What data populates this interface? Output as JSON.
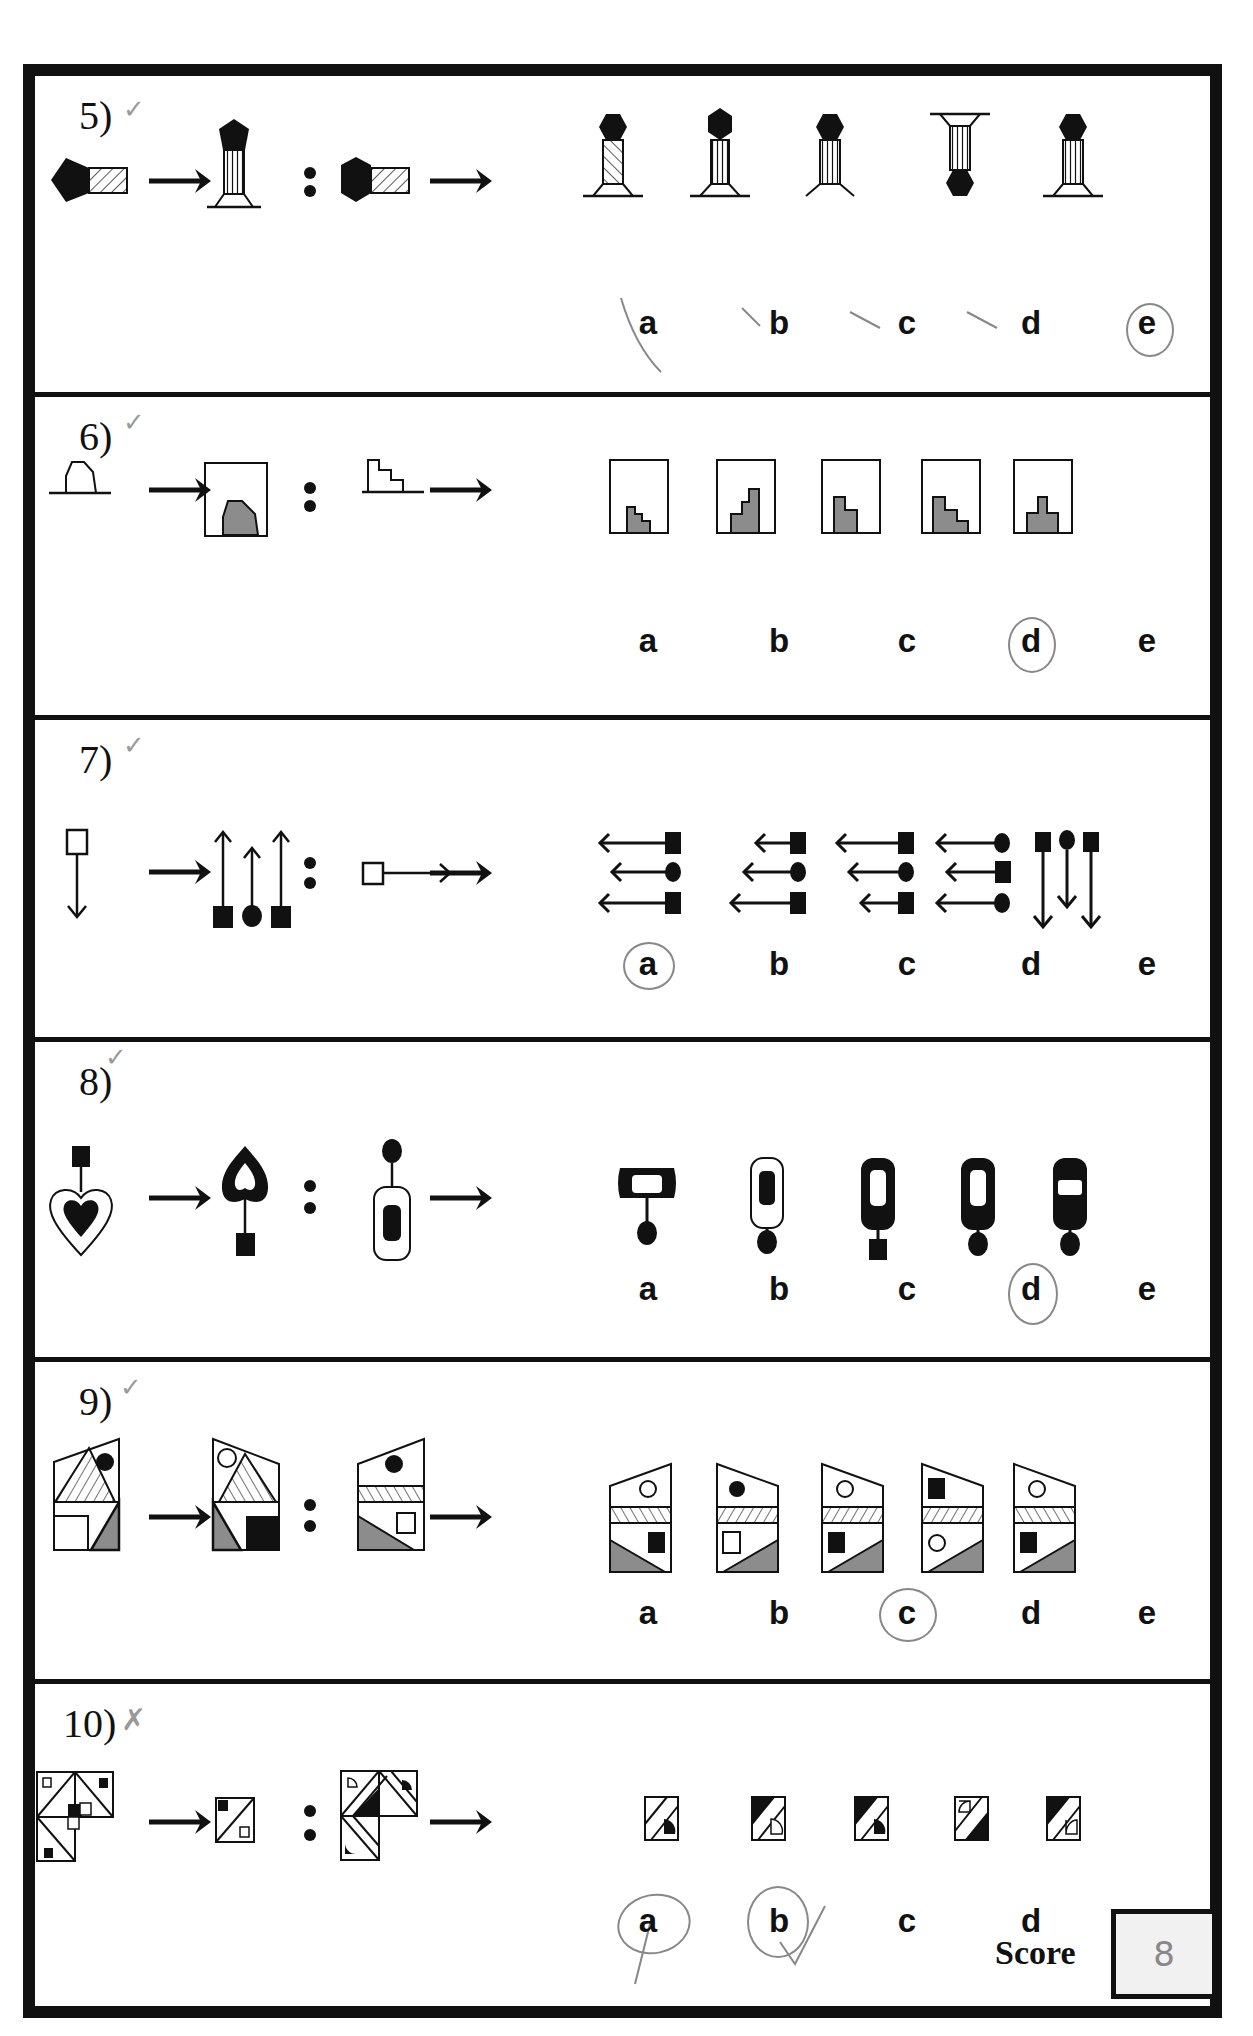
{
  "worksheet": {
    "questions": [
      {
        "number": "5)",
        "mark": "✓",
        "options": [
          "a",
          "b",
          "c",
          "d",
          "e"
        ],
        "circled": "e",
        "crossed_out": [
          "a",
          "b",
          "c",
          "d"
        ]
      },
      {
        "number": "6)",
        "mark": "✓",
        "options": [
          "a",
          "b",
          "c",
          "d",
          "e"
        ],
        "circled": "d"
      },
      {
        "number": "7)",
        "mark": "✓",
        "options": [
          "a",
          "b",
          "c",
          "d",
          "e"
        ],
        "circled": "a"
      },
      {
        "number": "8)",
        "mark": "✓",
        "options": [
          "a",
          "b",
          "c",
          "d",
          "e"
        ],
        "circled": "d"
      },
      {
        "number": "9)",
        "mark": "✓",
        "options": [
          "a",
          "b",
          "c",
          "d",
          "e"
        ],
        "circled": "c"
      },
      {
        "number": "10)",
        "mark": "✗",
        "options": [
          "a",
          "b",
          "c",
          "d",
          "e"
        ],
        "circled": [
          "a",
          "b"
        ],
        "tick_next_to": "b"
      }
    ],
    "score": {
      "label": "Score",
      "value": "8"
    },
    "colors": {
      "ink": "#111111",
      "shade": "#8c8c8c",
      "pencil": "#888888",
      "score_bg": "#f1f1f1"
    }
  }
}
